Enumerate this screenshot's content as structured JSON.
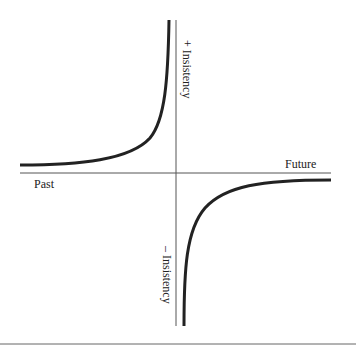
{
  "diagram": {
    "axes": {
      "x_left_label": "Past",
      "x_right_label": "Future",
      "y_top_label": "+ Insistency",
      "y_bottom_label": "– Insistency"
    },
    "colors": {
      "axis": "#555555",
      "curve": "#222222",
      "rule": "#666666"
    }
  }
}
